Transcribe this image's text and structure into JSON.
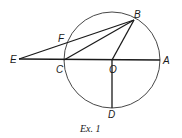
{
  "figure": {
    "caption": "Ex. 1",
    "colors": {
      "stroke": "#1a1a1a",
      "background": "#ffffff"
    },
    "circle": {
      "center": "O",
      "cx": 112,
      "cy": 60,
      "r": 48
    },
    "points": {
      "A": {
        "label": "A",
        "x": 160,
        "y": 60
      },
      "B": {
        "label": "B",
        "x": 134,
        "y": 20
      },
      "C": {
        "label": "C",
        "x": 64,
        "y": 60
      },
      "D": {
        "label": "D",
        "x": 112,
        "y": 108
      },
      "E": {
        "label": "E",
        "x": 19,
        "y": 59
      },
      "F": {
        "label": "F",
        "x": 68,
        "y": 42
      },
      "O": {
        "label": "O",
        "x": 112,
        "y": 60
      }
    },
    "segments": [
      "EA",
      "EB",
      "CB",
      "OB",
      "OD"
    ]
  }
}
